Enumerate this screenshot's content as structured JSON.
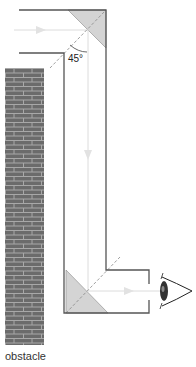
{
  "diagram": {
    "angle_label": "45°",
    "obstacle_label": "obstacle",
    "colors": {
      "outline": "#555555",
      "mirror_fill": "#d4d4d4",
      "brick": "#6b6b6b",
      "mortar": "#a8a8a8",
      "ray": "#dcdcdc",
      "normal": "#888888"
    },
    "elements": [
      "periscope-tube",
      "top-mirror",
      "bottom-mirror",
      "light-ray",
      "eye",
      "brick-wall"
    ]
  }
}
